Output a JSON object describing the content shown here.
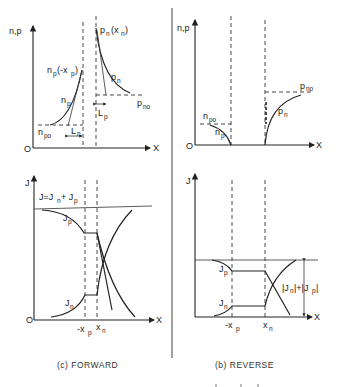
{
  "figure": {
    "divider_color": "#444444",
    "panels": [
      {
        "id": "forward",
        "caption": "(c)  FORWARD",
        "carrier_plot": {
          "y_axis_label": "n,p",
          "x_axis_label": "X",
          "origin_label": "O",
          "labels": {
            "pn_xn": "p",
            "pn_xn_sub": "n",
            "pn_xn_arg": "(x",
            "pn_xn_arg_sub": "n",
            "pn_xn_close": ")",
            "np_mxp": "n",
            "np_mxp_sub": "p",
            "np_mxp_arg": "(-x",
            "np_mxp_arg_sub": "p",
            "np_mxp_close": ")",
            "pn": "p",
            "pn_sub": "n",
            "np": "n",
            "np_sub": "p",
            "pno": "p",
            "pno_sub": "no",
            "npo": "n",
            "npo_sub": "po",
            "Lp": "L",
            "Lp_sub": "p",
            "Ln": "L",
            "Ln_sub": "n"
          }
        },
        "current_plot": {
          "y_axis_label": "J",
          "x_axis_label": "X",
          "origin_label": "O",
          "total_label": "J=J",
          "total_sub1": "n",
          "total_plus": " + J",
          "total_sub2": "p",
          "Jp": "J",
          "Jp_sub": "p",
          "Jn": "J",
          "Jn_sub": "n",
          "tick_mxp": "-x",
          "tick_mxp_sub": "p",
          "tick_xn": "x",
          "tick_xn_sub": "n"
        }
      },
      {
        "id": "reverse",
        "caption": "(b)  REVERSE",
        "carrier_plot": {
          "y_axis_label": "n,p",
          "x_axis_label": "X",
          "origin_label": "O",
          "labels": {
            "pno": "p",
            "pno_sub": "no",
            "npo": "n",
            "npo_sub": "po",
            "pn": "p",
            "pn_sub": "n",
            "np": "n",
            "np_sub": "p"
          }
        },
        "current_plot": {
          "y_axis_label": "J",
          "x_axis_label": "X",
          "Jp": "J",
          "Jp_sub": "p",
          "Jn": "J",
          "Jn_sub": "n",
          "total_label": "|J",
          "total_sub1": "n",
          "total_mid": "|+|J",
          "total_sub2": "p",
          "total_end": "|",
          "tick_mxp": "-x",
          "tick_mxp_sub": "p",
          "tick_xn": "x",
          "tick_xn_sub": "n"
        }
      }
    ]
  }
}
